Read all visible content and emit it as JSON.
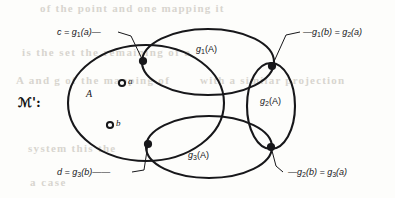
{
  "figure": {
    "kind": "set-diagram",
    "structure_label": "ℳ':",
    "structure_label_plain": "A':",
    "main_set_label": "A",
    "points": [
      {
        "name": "a",
        "label": "a",
        "x": 122,
        "y": 83
      },
      {
        "name": "b",
        "label": "b",
        "x": 110,
        "y": 125
      }
    ],
    "regions": [
      {
        "name": "g1-image",
        "label": "g",
        "sub": "1",
        "suffix": "(A)",
        "x": 196,
        "y": 44
      },
      {
        "name": "g2-image",
        "label": "g",
        "sub": "2",
        "suffix": "(A)",
        "x": 267,
        "y": 96
      },
      {
        "name": "g3-image",
        "label": "g",
        "sub": "3",
        "suffix": "(A)",
        "x": 188,
        "y": 150
      }
    ],
    "callouts": [
      {
        "name": "c-equals-g1-a",
        "text_pre": "c = g",
        "sub": "1",
        "text_post": "(a)",
        "dash": "—",
        "x": 60,
        "y": 28,
        "anchor": "upper-left-node"
      },
      {
        "name": "g1-b-equals-g2-a",
        "dash": "—",
        "text_pre": "g",
        "sub": "1",
        "mid": "(b) = g",
        "sub2": "2",
        "text_post": "(a)",
        "x": 303,
        "y": 28,
        "anchor": "upper-right-node"
      },
      {
        "name": "d-equals-g3-b",
        "text_pre": "d = g",
        "sub": "3",
        "text_post": "(b)",
        "dash": "——",
        "x": 60,
        "y": 168,
        "anchor": "lower-left-node"
      },
      {
        "name": "g2-b-equals-g3-a",
        "dash": "—",
        "text_pre": "g",
        "sub": "2",
        "mid": "(b) = g",
        "sub2": "3",
        "text_post": "(a)",
        "x": 286,
        "y": 168,
        "anchor": "lower-right-node"
      }
    ],
    "nodes": [
      {
        "name": "upper-left-node",
        "x": 143,
        "y": 61
      },
      {
        "name": "upper-right-node",
        "x": 272,
        "y": 66
      },
      {
        "name": "lower-right-node",
        "x": 271,
        "y": 147
      },
      {
        "name": "lower-left-node",
        "x": 148,
        "y": 144
      }
    ],
    "colors": {
      "stroke": "#17171a",
      "background": "#fdfdfb",
      "bleed_text": "#d8d5cf"
    }
  },
  "background_bleed": {
    "note": "faint show-through text from reverse page",
    "lines": [
      {
        "text": "of the point  and one  mapping  it",
        "x": 40,
        "y": 2,
        "size": 11,
        "letter_spacing": 1.2
      },
      {
        "text": "is the  set  the  remaining  of  a",
        "x": 22,
        "y": 46,
        "size": 11,
        "letter_spacing": 1.4
      },
      {
        "text": "A  and  g  of  the  mapping  of",
        "x": 16,
        "y": 74,
        "size": 11,
        "letter_spacing": 1.3
      },
      {
        "text": "with  a  similar  projection",
        "x": 200,
        "y": 74,
        "size": 11,
        "letter_spacing": 1.2
      },
      {
        "text": "system  this  the",
        "x": 28,
        "y": 142,
        "size": 11,
        "letter_spacing": 1.3
      },
      {
        "text": "a   case",
        "x": 30,
        "y": 176,
        "size": 11,
        "letter_spacing": 1.5
      }
    ]
  }
}
